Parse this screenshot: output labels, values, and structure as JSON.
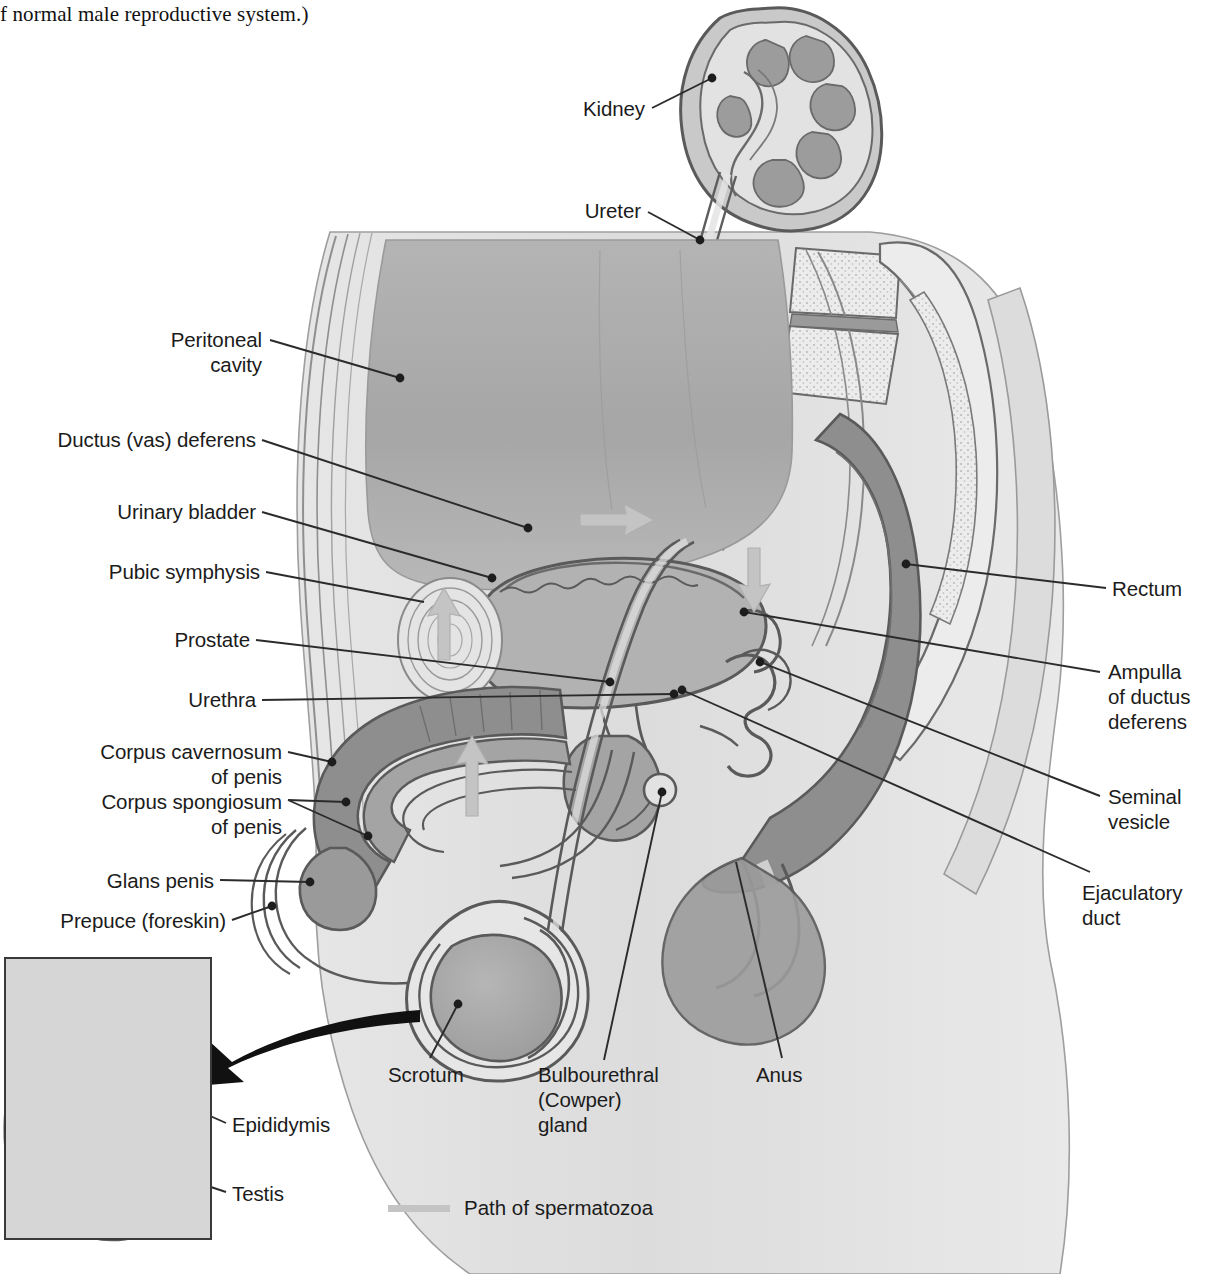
{
  "caption": {
    "text": "f normal male reproductive system.)"
  },
  "figure": {
    "colors": {
      "outline": "#4a4a4a",
      "dark_gray": "#8e8e8e",
      "mid_gray": "#a8a8a8",
      "light_gray": "#d2d2d2",
      "pale_gray": "#e8e8e8",
      "white": "#ffffff",
      "leader_line": "#2b2b2b",
      "sperm_path": "#c4c4c4",
      "inset_background": "#d6d6d6",
      "inset_border": "#3a3a3a"
    }
  },
  "labels": {
    "kidney": "Kidney",
    "ureter": "Ureter",
    "peritoneal_cavity": "Peritoneal\ncavity",
    "ductus_vas_deferens": "Ductus (vas) deferens",
    "urinary_bladder": "Urinary bladder",
    "pubic_symphysis": "Pubic symphysis",
    "prostate": "Prostate",
    "urethra": "Urethra",
    "corpus_cavernosum": "Corpus cavernosum\nof penis",
    "corpus_spongiosum": "Corpus spongiosum\nof penis",
    "glans_penis": "Glans penis",
    "prepuce": "Prepuce (foreskin)",
    "rectum": "Rectum",
    "ampulla": "Ampulla\nof ductus\ndeferens",
    "seminal_vesicle": "Seminal\nvesicle",
    "ejaculatory_duct": "Ejaculatory\nduct",
    "scrotum": "Scrotum",
    "bulbourethral_gland": "Bulbourethral\n(Cowper)\ngland",
    "anus": "Anus",
    "epididymis": "Epididymis",
    "testis": "Testis"
  },
  "legend": {
    "label": "Path of spermatozoa",
    "swatch_color": "#c4c4c4"
  }
}
